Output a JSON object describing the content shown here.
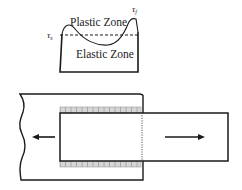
{
  "stress_plot": {
    "plastic_zone_label": "Plastic Zone",
    "elastic_zone_label": "Elastic Zone",
    "tau_s_label": "τ",
    "tau_s_sub": "s",
    "tau_f_label": "τ",
    "tau_f_sub": "f"
  },
  "pullout": {
    "left_arrow": "arrow-left",
    "right_arrow": "arrow-right"
  },
  "colors": {
    "line": "#1a1a1a",
    "hatch": "#9a9a9a",
    "hatch_fill": "#d6d6d6"
  }
}
